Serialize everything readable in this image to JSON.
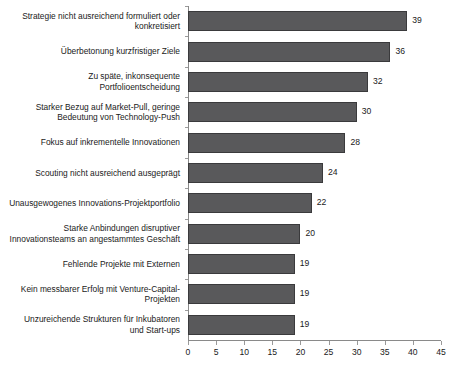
{
  "chart_data": {
    "type": "bar",
    "orientation": "horizontal",
    "title": "",
    "subtitle": "",
    "xlabel": "",
    "ylabel": "",
    "xlim": [
      0,
      45
    ],
    "xticks": [
      0,
      5,
      10,
      15,
      20,
      25,
      30,
      35,
      40,
      45
    ],
    "grid": false,
    "legend": null,
    "bar_color": "#59595b",
    "bar_border_color": "#3a3a3c",
    "axis_color": "#8a8a8a",
    "show_value_labels": true,
    "categories": [
      "Strategie nicht ausreichend formuliert oder konkretisiert",
      "Überbetonung kurzfristiger Ziele",
      "Zu späte, inkonsequente Portfolioentscheidung",
      "Starker Bezug auf Market-Pull, geringe Bedeutung von Technology-Push",
      "Fokus auf inkrementelle Innovationen",
      "Scouting nicht ausreichend ausgeprägt",
      "Unausgewogenes Innovations-Projektportfolio",
      "Starke Anbindungen disruptiver Innovationsteams an angestammtes Geschäft",
      "Fehlende Projekte mit Externen",
      "Kein messbarer Erfolg mit Venture-Capital-Projekten",
      "Unzureichende Strukturen für Inkubatoren und Start-ups"
    ],
    "category_lines": [
      [
        "Strategie nicht ausreichend formuliert oder",
        "konkretisiert"
      ],
      [
        "Überbetonung kurzfristiger Ziele"
      ],
      [
        "Zu späte, inkonsequente",
        "Portfolioentscheidung"
      ],
      [
        "Starker Bezug auf Market-Pull, geringe",
        "Bedeutung von Technology-Push"
      ],
      [
        "Fokus auf inkrementelle Innovationen"
      ],
      [
        "Scouting nicht ausreichend ausgeprägt"
      ],
      [
        "Unausgewogenes Innovations-Projektportfolio"
      ],
      [
        "Starke Anbindungen disruptiver",
        "Innovationsteams an angestammtes Geschäft"
      ],
      [
        "Fehlende Projekte mit Externen"
      ],
      [
        "Kein messbarer Erfolg mit Venture-Capital-",
        "Projekten"
      ],
      [
        "Unzureichende Strukturen für Inkubatoren",
        "und Start-ups"
      ]
    ],
    "values": [
      39,
      36,
      32,
      30,
      28,
      24,
      22,
      20,
      19,
      19,
      19
    ]
  }
}
